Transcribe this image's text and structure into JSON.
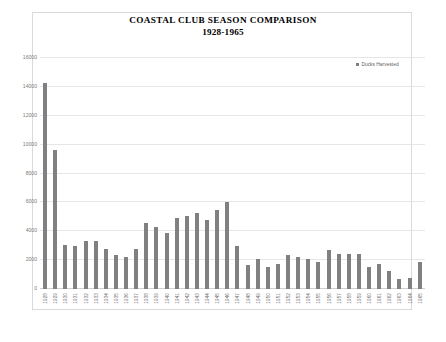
{
  "chart_data": {
    "type": "bar",
    "title": "COASTAL CLUB SEASON COMPARISON",
    "subtitle": "1928-1965",
    "xlabel": "",
    "ylabel": "",
    "ylim": [
      0,
      16000
    ],
    "yticks": [
      0,
      2000,
      4000,
      6000,
      8000,
      10000,
      12000,
      14000,
      16000
    ],
    "ytick_labels": [
      "0",
      "2000",
      "4000",
      "6000",
      "8000",
      "10000",
      "12000",
      "14000",
      "16000"
    ],
    "grid": true,
    "legend_position": "top-right",
    "series_color": "#808080",
    "categories": [
      "1928",
      "1929",
      "1930",
      "1931",
      "1932",
      "1933",
      "1934",
      "1935",
      "1936",
      "1937",
      "1938",
      "1939",
      "1940",
      "1941",
      "1942",
      "1943",
      "1944",
      "1945",
      "1946",
      "1947",
      "1948",
      "1949",
      "1950",
      "1951",
      "1952",
      "1953",
      "1954",
      "1955",
      "1956",
      "1957",
      "1958",
      "1959",
      "1960",
      "1961",
      "1962",
      "1963",
      "1964",
      "1965"
    ],
    "series": [
      {
        "name": "Ducks Harvested",
        "values": [
          14300,
          9600,
          3050,
          2950,
          3300,
          3350,
          2800,
          2350,
          2200,
          2750,
          4550,
          4300,
          3900,
          4950,
          5050,
          5250,
          4750,
          5500,
          6000,
          3000,
          1650,
          2050,
          1550,
          1700,
          2350,
          2200,
          2100,
          1900,
          2700,
          2450,
          2450,
          2400,
          1500,
          1700,
          1250,
          700,
          750,
          1900
        ]
      }
    ]
  },
  "legend": {
    "entries": [
      {
        "label": "Ducks Harvested",
        "color": "#808080"
      }
    ]
  }
}
